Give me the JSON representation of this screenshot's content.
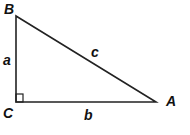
{
  "diagram": {
    "type": "right-triangle",
    "vertices": {
      "B": "B",
      "C": "C",
      "A": "A"
    },
    "sides": {
      "a": "a",
      "b": "b",
      "c": "c"
    },
    "right_angle_at": "C",
    "line_color": "#222222"
  }
}
